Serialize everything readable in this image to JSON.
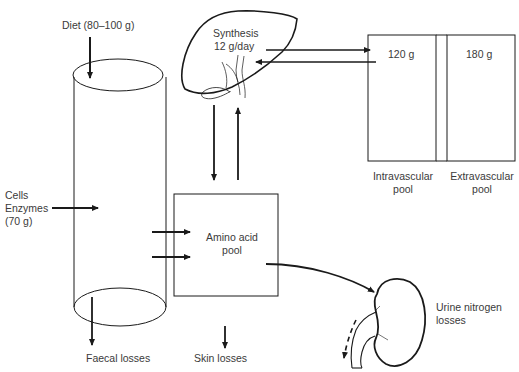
{
  "labels": {
    "diet": "Diet (80–100 g)",
    "synthesis_line1": "Synthesis",
    "synthesis_line2": "12 g/day",
    "intravascular_amount": "120 g",
    "extravascular_amount": "180 g",
    "intravascular_line1": "Intravascular",
    "intravascular_line2": "pool",
    "extravascular_line1": "Extravascular",
    "extravascular_line2": "pool",
    "cells_line1": "Cells",
    "cells_line2": "Enzymes",
    "cells_line3": "(70 g)",
    "amino_line1": "Amino acid",
    "amino_line2": "pool",
    "urine_line1": "Urine nitrogen",
    "urine_line2": "losses",
    "faecal": "Faecal losses",
    "skin": "Skin losses"
  },
  "colors": {
    "stroke": "#1a1a1a",
    "text": "#3a3a3a",
    "background": "#ffffff"
  }
}
